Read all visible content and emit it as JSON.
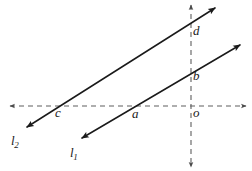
{
  "figure": {
    "width": 252,
    "height": 171,
    "background": "#ffffff",
    "stroke_color": "#1a1a1a",
    "axis_color": "#6b6b6b"
  },
  "axes": {
    "horizontal": {
      "name": "x-axis",
      "style": "dashed",
      "y": 106,
      "x_start": 10,
      "x_end": 246,
      "arrows": "both"
    },
    "vertical": {
      "name": "y-axis",
      "style": "dashed",
      "x": 191,
      "y_start": 5,
      "y_end": 167,
      "arrows": "both"
    }
  },
  "lines": [
    {
      "id": "l1",
      "label": "l",
      "subscript": "1",
      "style": "solid",
      "arrows": "both",
      "from": {
        "x": 82,
        "y": 138
      },
      "to": {
        "x": 240,
        "y": 45
      },
      "label_position": {
        "x": 70,
        "y": 146
      }
    },
    {
      "id": "l2",
      "label": "l",
      "subscript": "2",
      "style": "solid",
      "arrows": "both",
      "from": {
        "x": 27,
        "y": 127
      },
      "to": {
        "x": 215,
        "y": 8
      },
      "label_position": {
        "x": 11,
        "y": 134
      }
    }
  ],
  "points": [
    {
      "id": "d",
      "label": "d",
      "x": 191,
      "y": 40,
      "label_x": 193,
      "label_y": 24,
      "description": "intersection of l2 with vertical axis"
    },
    {
      "id": "b",
      "label": "b",
      "x": 191,
      "y": 83,
      "label_x": 193,
      "label_y": 69,
      "description": "intersection of l1 with vertical axis"
    },
    {
      "id": "c",
      "label": "c",
      "x": 60,
      "y": 106,
      "label_x": 55,
      "label_y": 106,
      "description": "intersection of l2 with horizontal axis"
    },
    {
      "id": "a",
      "label": "a",
      "x": 137,
      "y": 106,
      "label_x": 132,
      "label_y": 107,
      "description": "intersection of l1 with horizontal axis"
    },
    {
      "id": "o",
      "label": "o",
      "x": 191,
      "y": 106,
      "label_x": 193,
      "label_y": 106,
      "description": "origin"
    }
  ]
}
